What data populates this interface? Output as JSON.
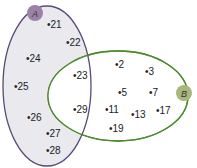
{
  "sets": {
    "A": {
      "label": "A",
      "outline_color": "#5a4a78",
      "fill_color": "#e9e9ee",
      "badge_color": "#9c82a8",
      "only_elements": [
        "21",
        "22",
        "24",
        "25",
        "26",
        "27",
        "28"
      ]
    },
    "B": {
      "label": "B",
      "outline_color": "#4f8a2e",
      "fill_color": "#ffffff",
      "badge_color": "#a9b87a",
      "only_elements": [
        "2",
        "3",
        "5",
        "7",
        "11",
        "13",
        "17",
        "19"
      ]
    },
    "intersection": [
      "23",
      "29"
    ]
  },
  "elements": [
    {
      "id": "21",
      "label": "•21"
    },
    {
      "id": "22",
      "label": "•22"
    },
    {
      "id": "24",
      "label": "•24"
    },
    {
      "id": "25",
      "label": "•25"
    },
    {
      "id": "26",
      "label": "•26"
    },
    {
      "id": "27",
      "label": "•27"
    },
    {
      "id": "28",
      "label": "•28"
    },
    {
      "id": "23",
      "label": "•23"
    },
    {
      "id": "29",
      "label": "•29"
    },
    {
      "id": "2",
      "label": "•2"
    },
    {
      "id": "3",
      "label": "•3"
    },
    {
      "id": "5",
      "label": "•5"
    },
    {
      "id": "7",
      "label": "•7"
    },
    {
      "id": "11",
      "label": "•11"
    },
    {
      "id": "13",
      "label": "•13"
    },
    {
      "id": "17",
      "label": "•17"
    },
    {
      "id": "19",
      "label": "•19"
    }
  ]
}
